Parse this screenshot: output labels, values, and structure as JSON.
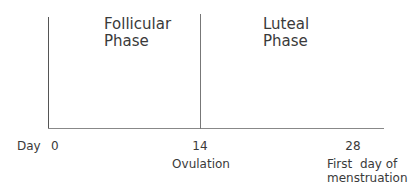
{
  "diagram": {
    "type": "menstrual-cycle-timeline",
    "axis_label": "Day",
    "phases": [
      {
        "line1": "Follicular",
        "line2": "Phase"
      },
      {
        "line1": "Luteal",
        "line2": "Phase"
      }
    ],
    "ticks": [
      {
        "day": "0",
        "note1": "",
        "note2": ""
      },
      {
        "day": "14",
        "note1": "Ovulation",
        "note2": ""
      },
      {
        "day": "28",
        "note1": "First  day of",
        "note2": "menstruation"
      }
    ],
    "line_color": "#555555"
  }
}
